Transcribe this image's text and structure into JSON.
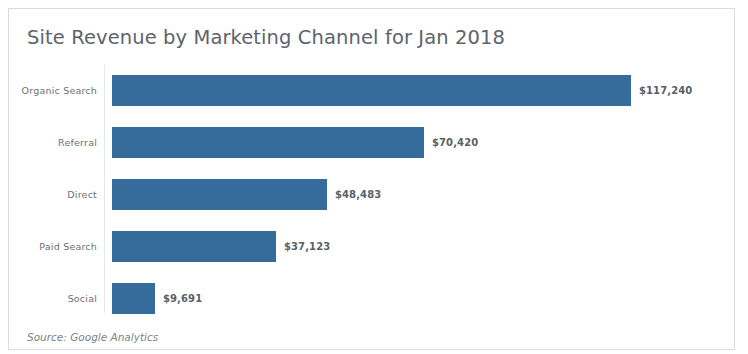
{
  "card": {
    "title": "Site Revenue by Marketing Channel for Jan 2018",
    "source_note": "Source: Google Analytics"
  },
  "chart_data": {
    "type": "bar",
    "orientation": "horizontal",
    "title": "Site Revenue by Marketing Channel for Jan 2018",
    "xlabel": "",
    "ylabel": "",
    "categories": [
      "Organic Search",
      "Referral",
      "Direct",
      "Paid Search",
      "Social"
    ],
    "values": [
      117240,
      70420,
      48483,
      37123,
      9691
    ],
    "value_labels": [
      "$117,240",
      "$70,420",
      "$48,483",
      "$37,123",
      "$9,691"
    ],
    "xlim": [
      0,
      117240
    ],
    "grid": false,
    "legend": false,
    "bar_color": "#366c9c",
    "annotations": [
      "Source: Google Analytics"
    ]
  }
}
